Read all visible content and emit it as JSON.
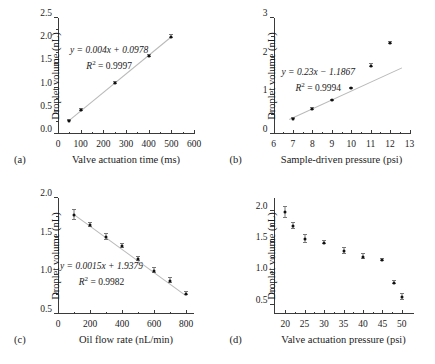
{
  "figure": {
    "panels": [
      "a",
      "b",
      "c",
      "d"
    ]
  },
  "panel_a": {
    "tag": "(a)",
    "equation": "y = 0.004x + 0.0978",
    "r2": "R2 = 0.9997"
  },
  "panel_b": {
    "tag": "(b)",
    "equation": "y = 0.23x − 1.1867",
    "r2": "R2 = 0.9994"
  },
  "panel_c": {
    "tag": "(c)",
    "equation": "y = 0.0015x + 1.9379",
    "r2": "R2 = 0.9982"
  },
  "panel_d": {
    "tag": "(d)"
  },
  "chart_data": [
    {
      "type": "scatter",
      "panel": "a",
      "title": "",
      "xlabel": "Valve actuation time (ms)",
      "ylabel": "Droplet volume (nL)",
      "xlim": [
        0,
        600
      ],
      "ylim": [
        0.0,
        2.5
      ],
      "xticks": [
        0,
        100,
        200,
        300,
        400,
        500,
        600
      ],
      "xticklabels": [
        "0",
        "100",
        "200",
        "300",
        "400",
        "500",
        "600"
      ],
      "yticks": [
        0.0,
        0.5,
        1.0,
        1.5,
        2.0,
        2.5
      ],
      "yticklabels": [
        "0.0",
        "0.5",
        "1.0",
        "1.5",
        "2.0",
        "2.5"
      ],
      "grid": false,
      "legend": null,
      "x": [
        50,
        100,
        250,
        400,
        500
      ],
      "y": [
        0.29,
        0.51,
        1.1,
        1.68,
        2.1
      ],
      "yerr": [
        0.02,
        0.02,
        0.02,
        0.03,
        0.03
      ],
      "fit": {
        "slope": 0.004,
        "intercept": 0.0978,
        "r2": 0.9997,
        "xfrom": 50,
        "xto": 500
      },
      "annotations": [
        "y = 0.004x + 0.0978",
        "R2 = 0.9997"
      ]
    },
    {
      "type": "scatter",
      "panel": "b",
      "title": "",
      "xlabel": "Sample-driven pressure (psi)",
      "ylabel": "Droplet volume (nL)",
      "xlim": [
        6,
        13
      ],
      "ylim": [
        0,
        3
      ],
      "xticks": [
        6,
        7,
        8,
        9,
        10,
        11,
        12,
        13
      ],
      "xticklabels": [
        "6",
        "7",
        "8",
        "9",
        "10",
        "11",
        "12",
        "13"
      ],
      "yticks": [
        0,
        1,
        2,
        3
      ],
      "yticklabels": [
        "0",
        "1",
        "2",
        "3"
      ],
      "grid": false,
      "legend": null,
      "x": [
        7,
        8,
        9,
        10,
        11,
        12
      ],
      "y": [
        0.4,
        0.65,
        0.87,
        1.18,
        1.77,
        2.35
      ],
      "yerr": [
        0.02,
        0.02,
        0.02,
        0.02,
        0.03,
        0.03
      ],
      "fit": {
        "slope": 0.23,
        "intercept": -1.1867,
        "r2": 0.9994,
        "xfrom": 6.8,
        "xto": 12.6
      },
      "annotations": [
        "y = 0.23x − 1.1867",
        "R2 = 0.9994"
      ]
    },
    {
      "type": "scatter",
      "panel": "c",
      "title": "",
      "xlabel": "Oil flow rate (nL/min)",
      "ylabel": "Droplet volume (nL)",
      "xlim": [
        0,
        850
      ],
      "ylim": [
        0.5,
        2.0
      ],
      "xticks": [
        0,
        200,
        400,
        600,
        800
      ],
      "xticklabels": [
        "0",
        "200",
        "400",
        "600",
        "800"
      ],
      "yticks": [
        0.5,
        1.0,
        1.5,
        2.0
      ],
      "yticklabels": [
        "0.5",
        "1.0",
        "1.5",
        "2.0"
      ],
      "grid": false,
      "legend": null,
      "x": [
        100,
        200,
        300,
        400,
        500,
        600,
        700,
        800
      ],
      "y": [
        1.78,
        1.65,
        1.5,
        1.38,
        1.21,
        1.06,
        0.93,
        0.76
      ],
      "yerr": [
        0.07,
        0.03,
        0.04,
        0.03,
        0.03,
        0.03,
        0.03,
        0.02
      ],
      "fit": {
        "slope": -0.0015,
        "intercept": 1.9379,
        "r2": 0.9982,
        "xfrom": 100,
        "xto": 800
      },
      "annotations": [
        "y = 0.0015x + 1.9379",
        "R2 = 0.9982"
      ]
    },
    {
      "type": "scatter",
      "panel": "d",
      "title": "",
      "xlabel": "Valve actuation pressure (psi)",
      "ylabel": "Droplet volume (nL)",
      "xlim": [
        17,
        53
      ],
      "ylim": [
        0.35,
        2.2
      ],
      "xticks": [
        20,
        25,
        30,
        35,
        40,
        45,
        50
      ],
      "xticklabels": [
        "20",
        "25",
        "30",
        "35",
        "40",
        "45",
        "50"
      ],
      "yticks": [
        0.5,
        1.0,
        1.5,
        2.0
      ],
      "yticklabels": [
        "0.5",
        "1.0",
        "1.5",
        "2.0"
      ],
      "grid": false,
      "legend": null,
      "x": [
        20,
        22,
        25,
        30,
        35,
        40,
        45,
        48,
        50
      ],
      "y": [
        1.97,
        1.75,
        1.55,
        1.49,
        1.35,
        1.26,
        1.21,
        0.85,
        0.62
      ],
      "yerr": [
        0.09,
        0.05,
        0.06,
        0.03,
        0.05,
        0.04,
        0.02,
        0.02,
        0.05
      ],
      "fit": null,
      "annotations": []
    }
  ]
}
